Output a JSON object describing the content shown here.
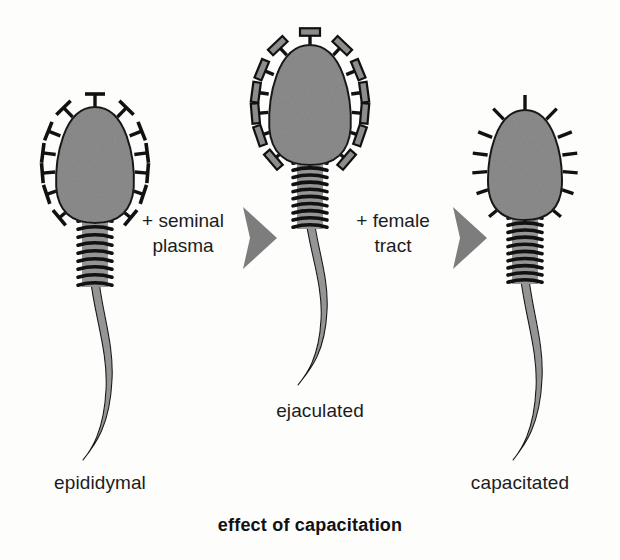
{
  "figure": {
    "caption": "effect of capacitation",
    "background_color": "#fdfdfc"
  },
  "palette": {
    "cell_fill": "#8d8d8d",
    "cell_outline": "#1a1a1a",
    "tail_fill": "#9a9a9a",
    "coil_stroke": "#111111",
    "arrow_fill": "#7d7d7d",
    "receptor_stroke": "#111111",
    "receptor_cap_fill": "#8d8d8d",
    "text_color": "#1c1c1c"
  },
  "stages": [
    {
      "id": "epididymal",
      "label": "epididymal",
      "receptor_style": "t-shaped-bare",
      "receptor_count": 13,
      "head_center_x": 95,
      "head_center_y": 165,
      "head_rx": 40,
      "head_ry": 58,
      "coil_count": 9,
      "tail_end_y": 460
    },
    {
      "id": "ejaculated",
      "label": "ejaculated",
      "receptor_style": "t-shaped-coated",
      "receptor_count": 13,
      "head_center_x": 310,
      "head_center_y": 105,
      "head_rx": 42,
      "head_ry": 60,
      "coil_count": 10,
      "tail_end_y": 385
    },
    {
      "id": "capacitated",
      "label": "capacitated",
      "receptor_style": "bare-spike",
      "receptor_count": 13,
      "head_center_x": 525,
      "head_center_y": 165,
      "head_rx": 38,
      "head_ry": 55,
      "coil_count": 10,
      "tail_end_y": 460
    }
  ],
  "transitions": [
    {
      "id": "seminal-plasma",
      "line1": "+ seminal",
      "line2": "plasma",
      "arrow_x": 243,
      "arrow_y": 238
    },
    {
      "id": "female-tract",
      "line1": "+ female",
      "line2": "tract",
      "arrow_x": 453,
      "arrow_y": 238
    }
  ]
}
